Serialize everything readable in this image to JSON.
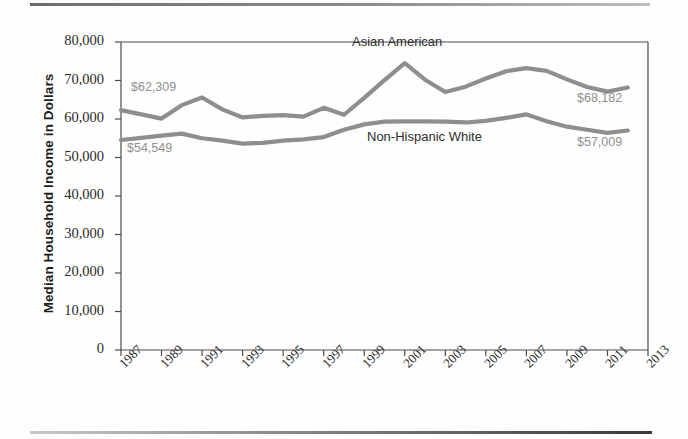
{
  "figure": {
    "top_rule": "horizontal-rule",
    "bottom_rule": "horizontal-rule"
  },
  "chart_data": {
    "type": "line",
    "title": "",
    "subtitle": "",
    "xlabel": "",
    "ylabel": "Median Household Income in Dollars",
    "xlim": [
      1987,
      2013
    ],
    "ylim": [
      0,
      80000
    ],
    "grid": false,
    "legend": "inline-labels",
    "y_ticks": [
      0,
      10000,
      20000,
      30000,
      40000,
      50000,
      60000,
      70000,
      80000
    ],
    "y_tick_labels": [
      "0",
      "10,000",
      "20,000",
      "30,000",
      "40,000",
      "50,000",
      "60,000",
      "70,000",
      "80,000"
    ],
    "x_ticks": [
      1987,
      1989,
      1991,
      1993,
      1995,
      1997,
      1999,
      2001,
      2003,
      2005,
      2007,
      2009,
      2011,
      2013
    ],
    "x_tick_labels": [
      "1987",
      "1989",
      "1991",
      "1993",
      "1995",
      "1997",
      "1999",
      "2001",
      "2003",
      "2005",
      "2007",
      "2009",
      "2011",
      "2013"
    ],
    "x": [
      1987,
      1988,
      1989,
      1990,
      1991,
      1992,
      1993,
      1994,
      1995,
      1996,
      1997,
      1998,
      1999,
      2000,
      2001,
      2002,
      2003,
      2004,
      2005,
      2006,
      2007,
      2008,
      2009,
      2010,
      2011,
      2012
    ],
    "series": [
      {
        "name": "Asian American",
        "color": "#8e8e8e",
        "values": [
          62309,
          61200,
          60100,
          63600,
          65600,
          62500,
          60400,
          60800,
          61000,
          60600,
          62900,
          61100,
          65500,
          70100,
          74500,
          70200,
          67000,
          68400,
          70500,
          72400,
          73200,
          72500,
          70300,
          68300,
          67100,
          68182
        ]
      },
      {
        "name": "Non-Hispanic White",
        "color": "#8e8e8e",
        "values": [
          54549,
          55100,
          55700,
          56200,
          55000,
          54400,
          53600,
          53800,
          54400,
          54700,
          55300,
          57200,
          58600,
          59300,
          59400,
          59400,
          59300,
          59100,
          59500,
          60300,
          61200,
          59400,
          58000,
          57200,
          56400,
          57009
        ]
      }
    ],
    "annotations": [
      {
        "name": "asian-american-start-value",
        "text": "$62,309",
        "series": "Asian American",
        "at_x": 1987,
        "value": 62309
      },
      {
        "name": "non-hispanic-white-start-value",
        "text": "$54,549",
        "series": "Non-Hispanic White",
        "at_x": 1987,
        "value": 54549
      },
      {
        "name": "asian-american-end-value",
        "text": "$68,182",
        "series": "Asian American",
        "at_x": 2012,
        "value": 68182
      },
      {
        "name": "non-hispanic-white-end-value",
        "text": "$57,009",
        "series": "Non-Hispanic White",
        "at_x": 2012,
        "value": 57009
      },
      {
        "name": "asian-american-series-label",
        "text": "Asian American"
      },
      {
        "name": "non-hispanic-white-series-label",
        "text": "Non-Hispanic White"
      }
    ]
  }
}
